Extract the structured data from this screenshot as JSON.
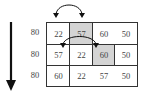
{
  "diagram": {
    "row_labels": [
      "80",
      "80",
      "80"
    ],
    "rows": [
      {
        "cells": [
          {
            "value": "22",
            "shaded": false
          },
          {
            "value": "57",
            "shaded": true
          },
          {
            "value": "60",
            "shaded": false
          },
          {
            "value": "50",
            "shaded": false
          }
        ]
      },
      {
        "cells": [
          {
            "value": "57",
            "shaded": false
          },
          {
            "value": "22",
            "shaded": false
          },
          {
            "value": "60",
            "shaded": true
          },
          {
            "value": "50",
            "shaded": false
          }
        ]
      },
      {
        "cells": [
          {
            "value": "60",
            "shaded": false
          },
          {
            "value": "22",
            "shaded": false
          },
          {
            "value": "57",
            "shaded": false
          },
          {
            "value": "50",
            "shaded": false
          }
        ]
      }
    ],
    "swap_arrows": [
      {
        "row": 0,
        "from_col": 0,
        "to_col": 1
      },
      {
        "row": 1,
        "from_col": 1,
        "to_col": 2
      }
    ],
    "direction_arrow": "down",
    "colors": {
      "shaded_cell": "#d4d4d4",
      "line": "#333333",
      "text": "#444444"
    }
  }
}
